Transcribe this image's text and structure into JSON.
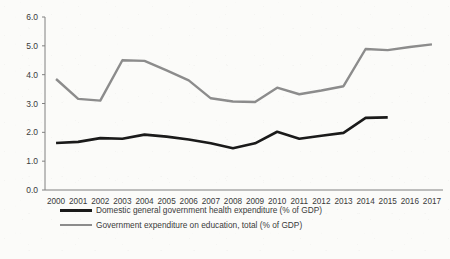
{
  "chart_data": {
    "type": "line",
    "title": "",
    "xlabel": "",
    "ylabel": "",
    "ylim": [
      0.0,
      6.0
    ],
    "ytick_step": 1.0,
    "grid": false,
    "legend_position": "bottom",
    "categories": [
      "2000",
      "2001",
      "2002",
      "2003",
      "2004",
      "2005",
      "2006",
      "2007",
      "2008",
      "2009",
      "2010",
      "2011",
      "2012",
      "2013",
      "2014",
      "2015",
      "2016",
      "2017"
    ],
    "ytick_labels": [
      "0.0",
      "1.0",
      "2.0",
      "3.0",
      "4.0",
      "5.0",
      "6.0"
    ],
    "series": [
      {
        "name": "Domestic general government health expenditure (% of GDP)",
        "color": "#1a1a1a",
        "stroke_width": 2.6,
        "values": [
          1.63,
          1.67,
          1.8,
          1.78,
          1.92,
          1.85,
          1.75,
          1.62,
          1.45,
          1.62,
          2.02,
          1.78,
          1.88,
          1.98,
          2.5,
          2.52,
          null,
          null
        ]
      },
      {
        "name": "Government expenditure on education, total (% of GDP)",
        "color": "#8c8c8c",
        "stroke_width": 2.4,
        "values": [
          3.85,
          3.16,
          3.1,
          4.5,
          4.48,
          4.15,
          3.8,
          3.18,
          3.07,
          3.05,
          3.55,
          3.32,
          3.45,
          3.6,
          4.89,
          4.85,
          4.96,
          5.05
        ]
      }
    ]
  },
  "legend": {
    "items": [
      {
        "label": "Domestic general government health expenditure (% of GDP)",
        "color": "#1a1a1a"
      },
      {
        "label": "Government expenditure on education, total (% of GDP)",
        "color": "#8c8c8c"
      }
    ]
  }
}
